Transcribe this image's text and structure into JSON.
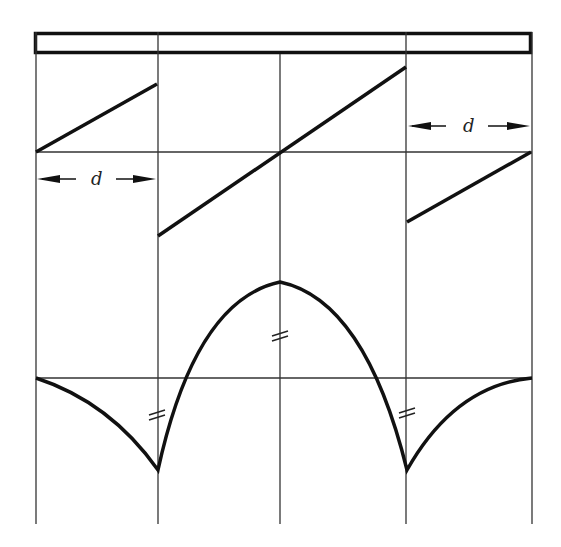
{
  "figure": {
    "colors": {
      "line": "#111111",
      "grid": "#333333",
      "background": "#ffffff"
    },
    "spans": 4,
    "support_x": [
      36,
      158,
      280,
      406,
      532
    ],
    "bar": {
      "x": 34,
      "y": 32,
      "width": 498,
      "height": 22
    },
    "dimension_labels": [
      {
        "text": "d",
        "position": "left-span, below middle axis"
      },
      {
        "text": "d",
        "position": "right-span, above middle axis"
      }
    ],
    "equal_marks": [
      {
        "symbol": "=",
        "location": "mid-span peak"
      },
      {
        "symbol": "=",
        "location": "left inner support"
      },
      {
        "symbol": "=",
        "location": "right inner support"
      }
    ]
  }
}
